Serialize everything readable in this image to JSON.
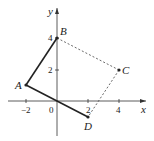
{
  "diagram": {
    "axes": {
      "x_label": "x",
      "y_label": "y"
    },
    "x_ticks": [
      {
        "value": -2,
        "label": "−2"
      },
      {
        "value": 0,
        "label": "0"
      },
      {
        "value": 2,
        "label": "2"
      },
      {
        "value": 4,
        "label": "4"
      }
    ],
    "y_ticks": [
      {
        "value": 2,
        "label": "2"
      },
      {
        "value": 4,
        "label": "4"
      }
    ],
    "points": [
      {
        "name": "A",
        "x": -2,
        "y": 1
      },
      {
        "name": "B",
        "x": 0,
        "y": 4
      },
      {
        "name": "C",
        "x": 4,
        "y": 2
      },
      {
        "name": "D",
        "x": 2,
        "y": -1
      }
    ],
    "solid_segments": [
      [
        "A",
        "B"
      ],
      [
        "A",
        "D"
      ]
    ],
    "dashed_segments": [
      [
        "B",
        "C"
      ],
      [
        "C",
        "D"
      ]
    ],
    "colors": {
      "line": "#222222",
      "dashed": "#444444"
    }
  }
}
